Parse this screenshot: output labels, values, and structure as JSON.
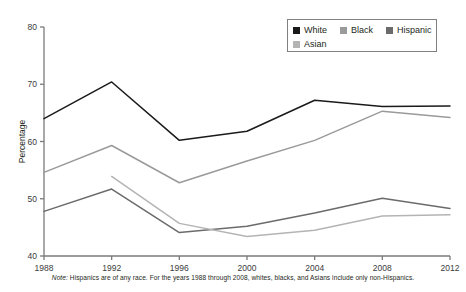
{
  "chart_data": {
    "type": "line",
    "title": "",
    "xlabel": "",
    "ylabel": "Percentage",
    "categories": [
      "1988",
      "1992",
      "1996",
      "2000",
      "2004",
      "2008",
      "2012"
    ],
    "x": [
      1988,
      1992,
      1996,
      2000,
      2004,
      2008,
      2012
    ],
    "xlim": [
      1988,
      2012
    ],
    "ylim": [
      40,
      80
    ],
    "yticks": [
      "40",
      "50",
      "60",
      "70",
      "80"
    ],
    "grid": false,
    "legend_position": "top-right",
    "series": [
      {
        "name": "White",
        "color": "#1a1a1a",
        "values": [
          64.0,
          70.4,
          60.2,
          61.8,
          67.2,
          66.1,
          66.2
        ]
      },
      {
        "name": "Black",
        "color": "#9a9a9a",
        "values": [
          54.6,
          59.3,
          52.8,
          56.6,
          60.2,
          65.3,
          64.2
        ]
      },
      {
        "name": "Hispanic",
        "color": "#6b6b6b",
        "values": [
          47.8,
          51.7,
          44.1,
          45.2,
          47.5,
          50.1,
          48.3
        ]
      },
      {
        "name": "Asian",
        "color": "#b4b4b4",
        "values": [
          null,
          53.9,
          45.7,
          43.4,
          44.5,
          47.0,
          47.2
        ]
      }
    ]
  },
  "legend": {
    "items": [
      {
        "label": "White",
        "color": "#1a1a1a"
      },
      {
        "label": "Black",
        "color": "#9a9a9a"
      },
      {
        "label": "Hispanic",
        "color": "#6b6b6b"
      },
      {
        "label": "Asian",
        "color": "#b4b4b4"
      }
    ]
  },
  "axes": {
    "y_title": "Percentage",
    "y_ticks": [
      "80",
      "70",
      "60",
      "50",
      "40"
    ],
    "x_ticks": [
      "1988",
      "1992",
      "1996",
      "2000",
      "2004",
      "2008",
      "2012"
    ]
  },
  "note": {
    "prefix": "Note:",
    "text": "Hispanics are of any race. For the years 1988 through 2008, whites, blacks, and Asians include only non-Hispanics."
  }
}
